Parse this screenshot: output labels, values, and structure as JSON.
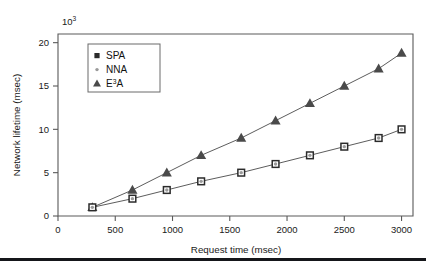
{
  "figure": {
    "background_color": "#ffffff",
    "axis_color": "#5a5a5a",
    "bottom_rule": {
      "color": "#15161a",
      "top": 258,
      "height": 3
    }
  },
  "chart_data": {
    "type": "line",
    "title": "",
    "subtitle": "",
    "xlabel": "Request time (msec)",
    "ylabel": "Network lifetime (msec)",
    "y_multiplier_label": "10",
    "y_multiplier_exponent": "3",
    "xlim": [
      0,
      3100
    ],
    "ylim": [
      0,
      21
    ],
    "xticks": [
      0,
      500,
      1000,
      1500,
      2000,
      2500,
      3000
    ],
    "xticklabels": [
      "0",
      "500",
      "1000",
      "1500",
      "2000",
      "2500",
      "3000"
    ],
    "yticks": [
      0,
      5,
      10,
      15,
      20
    ],
    "yticklabels": [
      "0",
      "5",
      "10",
      "15",
      "20"
    ],
    "grid": false,
    "legend_position": "upper left",
    "x": [
      300,
      650,
      950,
      1250,
      1600,
      1900,
      2200,
      2500,
      2800,
      3000
    ],
    "series": [
      {
        "name": "SPA",
        "marker": "square",
        "marker_color": "#2b2b2b",
        "line_color": "#4a4a4a",
        "values": [
          1,
          2,
          3,
          4,
          5,
          6,
          7,
          8,
          9,
          10
        ]
      },
      {
        "name": "NNA",
        "marker": "circle",
        "marker_color": "#9a9a9a",
        "line_color": "#4a4a4a",
        "values": [
          1,
          2,
          3,
          4,
          5,
          6,
          7,
          8,
          9,
          10
        ]
      },
      {
        "name": "E3A",
        "marker": "triangle",
        "marker_color": "#4a4a4a",
        "line_color": "#4a4a4a",
        "values": [
          1,
          3,
          5,
          7,
          9,
          11,
          13,
          15,
          17,
          18.8
        ]
      }
    ]
  },
  "legend": {
    "entries": [
      {
        "label": "SPA",
        "label_base": "SPA",
        "sup": "",
        "marker": "square",
        "color": "#2b2b2b"
      },
      {
        "label": "NNA",
        "label_base": "NNA",
        "sup": "",
        "marker": "circle",
        "color": "#9a9a9a"
      },
      {
        "label": "E3A",
        "label_base": "E",
        "sup": "3",
        "label_tail": "A",
        "marker": "triangle",
        "color": "#4a4a4a"
      }
    ]
  }
}
